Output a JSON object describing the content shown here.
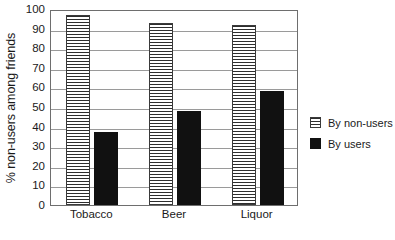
{
  "chart_data": {
    "type": "bar",
    "title": "",
    "xlabel": "",
    "ylabel": "% non-users among friends",
    "categories": [
      "Tobacco",
      "Beer",
      "Liquor"
    ],
    "series": [
      {
        "name": "By non-users",
        "values": [
          97,
          93,
          92
        ],
        "pattern": "horizontal-stripes",
        "color": "#ffffff"
      },
      {
        "name": "By users",
        "values": [
          37,
          48,
          58
        ],
        "pattern": "solid",
        "color": "#111111"
      }
    ],
    "ylim": [
      0,
      100
    ],
    "ytick_step": 10,
    "yticks": [
      0,
      10,
      20,
      30,
      40,
      50,
      60,
      70,
      80,
      90,
      100
    ],
    "ytick_labels": [
      "0",
      "10",
      "20",
      "30",
      "40",
      "50",
      "60",
      "70",
      "80",
      "90",
      "100"
    ],
    "grid": "horizontal",
    "legend_position": "right"
  },
  "legend": {
    "entries": [
      {
        "label": "By non-users"
      },
      {
        "label": "By users"
      }
    ]
  }
}
